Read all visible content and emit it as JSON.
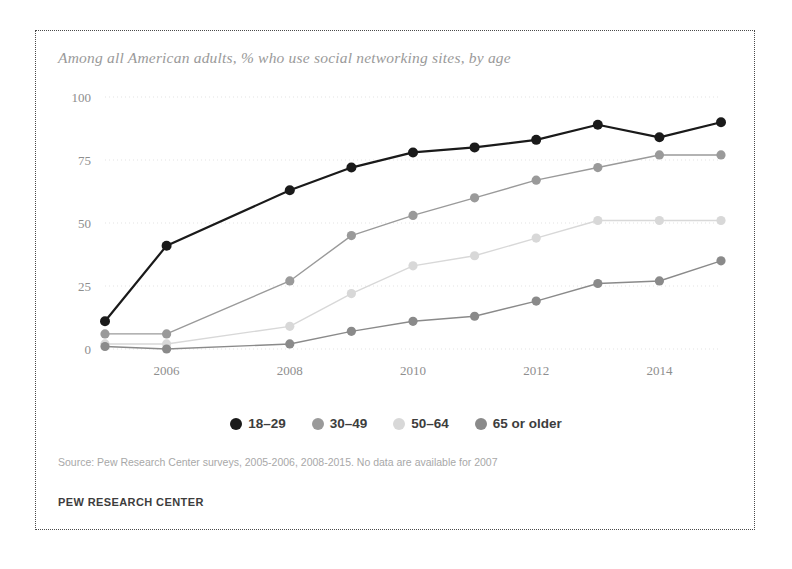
{
  "figure": {
    "title": "Among all American adults, % who use social networking sites, by age",
    "source_note": "Source: Pew Research Center surveys, 2005-2006, 2008-2015. No data are available for 2007",
    "org_footer": "PEW RESEARCH CENTER"
  },
  "colors": {
    "series_18_29": "#1a1a1a",
    "series_30_49": "#9a9a9a",
    "series_50_64": "#d8d8d8",
    "series_65_older": "#8a8a8a",
    "grid": "#e3e3e3",
    "tick_text": "#8e8e8e",
    "title_text": "#9a9a9a",
    "border": "#4a4a4a"
  },
  "chart_data": {
    "type": "line",
    "title": "Among all American adults, % who use social networking sites, by age",
    "xlabel": "",
    "ylabel": "",
    "x": [
      2005,
      2006,
      2008,
      2009,
      2010,
      2011,
      2012,
      2013,
      2014,
      2015
    ],
    "xlim": [
      2005,
      2015
    ],
    "ylim": [
      0,
      100
    ],
    "xticks": [
      2006,
      2008,
      2010,
      2012,
      2014
    ],
    "xticklabels": [
      "2006",
      "2008",
      "2010",
      "2012",
      "2014"
    ],
    "yticks": [
      0,
      25,
      50,
      75,
      100
    ],
    "yticklabels": [
      "0",
      "25",
      "50",
      "75",
      "100"
    ],
    "grid": true,
    "grid_axis": "y",
    "legend_position": "bottom",
    "markers": true,
    "series": [
      {
        "name": "18–29",
        "color": "#1a1a1a",
        "values": [
          11,
          41,
          63,
          72,
          78,
          80,
          83,
          89,
          84,
          90
        ]
      },
      {
        "name": "30–49",
        "color": "#9a9a9a",
        "values": [
          6,
          6,
          27,
          45,
          53,
          60,
          67,
          72,
          77,
          77
        ]
      },
      {
        "name": "50–64",
        "color": "#d8d8d8",
        "values": [
          2,
          2,
          9,
          22,
          33,
          37,
          44,
          51,
          51,
          51
        ]
      },
      {
        "name": "65 or older",
        "color": "#8a8a8a",
        "values": [
          1,
          0,
          2,
          7,
          11,
          13,
          19,
          26,
          27,
          35
        ]
      }
    ]
  },
  "legend": {
    "items": [
      {
        "label": "18–29",
        "color": "#1a1a1a"
      },
      {
        "label": "30–49",
        "color": "#9a9a9a"
      },
      {
        "label": "50–64",
        "color": "#d8d8d8"
      },
      {
        "label": "65 or older",
        "color": "#8a8a8a"
      }
    ]
  }
}
